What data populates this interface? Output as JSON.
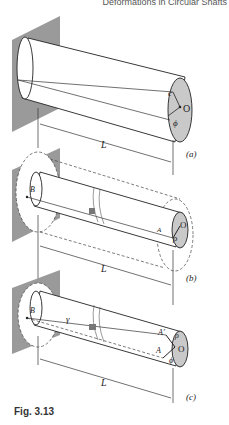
{
  "header": {
    "text": "Deformations in Circular Shafts"
  },
  "figure": {
    "caption": "Fig. 3.13",
    "panels": [
      {
        "id": "a",
        "label": "(a)",
        "length_label": "L",
        "end_labels": {
          "radius": "c",
          "center": "O",
          "angle": "ϕ"
        }
      },
      {
        "id": "b",
        "label": "(b)",
        "length_label": "L",
        "point_labels": {
          "fixed": "B",
          "end": "A",
          "center": "O",
          "radius": "ρ"
        }
      },
      {
        "id": "c",
        "label": "(c)",
        "length_label": "L",
        "point_labels": {
          "fixed": "B",
          "shear": "γ",
          "end_deformed": "A′",
          "end": "A",
          "center": "O",
          "radius": "ρ",
          "angle": "ϕ"
        }
      }
    ]
  }
}
